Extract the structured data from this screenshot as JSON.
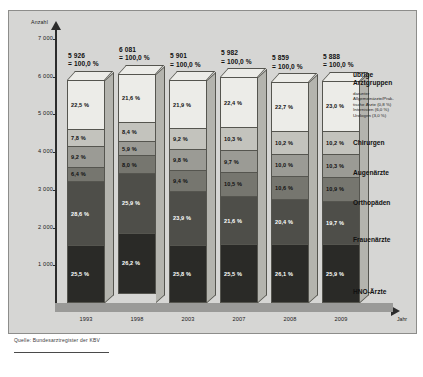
{
  "figure": {
    "y_axis_title": "Anzahl",
    "x_axis_title": "Jahr",
    "source": "Quelle: Bundesarztregister der KBV",
    "top_caption": ""
  },
  "y_ticks": [
    "7 000",
    "6 000",
    "5 000",
    "4 000",
    "3 000",
    "2 000",
    "1 000"
  ],
  "legend": {
    "group_title_line1": "übrige",
    "group_title_line2": "Arztgruppen",
    "sub_head": "darunter",
    "sub_items": [
      "Allgemeinärzte/Prak-",
      "tische Ärzte (0,8 %)",
      "Internisten (6,0 %)",
      "Urologen (3,0 %)"
    ],
    "items": [
      {
        "label": "Chirurgen",
        "top": 128
      },
      {
        "label": "Augenärzte",
        "top": 158
      },
      {
        "label": "Orthopäden",
        "top": 188
      },
      {
        "label": "Frauenärzte",
        "top": 225
      },
      {
        "label": "HNO-Ärzte",
        "top": 277
      }
    ]
  },
  "chart_data": {
    "type": "bar",
    "subtype": "stacked-100-percent-3d",
    "title": "",
    "xlabel": "Jahr",
    "ylabel": "Anzahl",
    "ylim": [
      0,
      7400
    ],
    "yticks": [
      1000,
      2000,
      3000,
      4000,
      5000,
      6000,
      7000
    ],
    "grid": false,
    "legend_position": "right",
    "categories": [
      "1993",
      "1998",
      "2003",
      "2007",
      "2008",
      "2009"
    ],
    "totals": [
      5926,
      6081,
      5901,
      5982,
      5859,
      5888
    ],
    "total_labels": [
      "5 926",
      "6 081",
      "5 901",
      "5 982",
      "5 859",
      "5 888"
    ],
    "total_pct_labels": [
      "= 100,0 %",
      "= 100,0 %",
      "= 100,0 %",
      "= 100,0 %",
      "= 100,0 %",
      "= 100,0 %"
    ],
    "series": [
      {
        "name": "übrige Arztgruppen",
        "color": "#ecece8",
        "values": [
          22.5,
          21.6,
          21.9,
          22.4,
          22.7,
          23.0
        ],
        "labels": [
          "22,5 %",
          "21,6 %",
          "21,9 %",
          "22,4 %",
          "22,7 %",
          "23,0 %"
        ]
      },
      {
        "name": "Chirurgen",
        "color": "#c3c3bd",
        "values": [
          7.8,
          8.4,
          9.2,
          10.3,
          10.2,
          10.2
        ],
        "labels": [
          "7,8 %",
          "8,4 %",
          "9,2 %",
          "10,3 %",
          "10,2 %",
          "10,2 %"
        ]
      },
      {
        "name": "Augenärzte",
        "color": "#9b9b95",
        "values": [
          9.2,
          5.9,
          9.8,
          9.7,
          10.0,
          10.3
        ],
        "labels": [
          "9,2 %",
          "5,9 %",
          "9,8 %",
          "9,7 %",
          "10,0 %",
          "10,3 %"
        ]
      },
      {
        "name": "Orthopäden",
        "color": "#76766f",
        "values": [
          6.4,
          8.0,
          9.4,
          10.5,
          10.6,
          10.9
        ],
        "labels": [
          "6,4 %",
          "8,0 %",
          "9,4 %",
          "10,5 %",
          "10,6 %",
          "10,9 %"
        ]
      },
      {
        "name": "Frauenärzte",
        "color": "#4e4e49",
        "values": [
          28.6,
          25.9,
          23.9,
          21.6,
          20.4,
          19.7
        ],
        "labels": [
          "28,6 %",
          "25,9 %",
          "23,9 %",
          "21,6 %",
          "20,4 %",
          "19,7 %"
        ]
      },
      {
        "name": "HNO-Ärzte",
        "color": "#2a2a27",
        "values": [
          25.5,
          26.2,
          25.8,
          25.5,
          26.1,
          25.9
        ],
        "labels": [
          "25,5 %",
          "26,2 %",
          "25,8 %",
          "25,5 %",
          "26,1 %",
          "25,9 %"
        ]
      }
    ]
  }
}
